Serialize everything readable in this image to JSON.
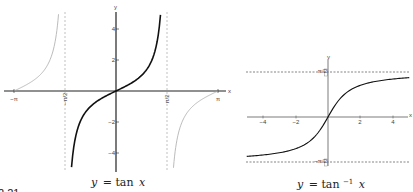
{
  "figure_label": "2.21",
  "chart_data": [
    {
      "type": "line",
      "title": "y = tan x",
      "caption": "y = tan x",
      "xlabel": "x",
      "ylabel": "y",
      "xlim": [
        -3.5,
        3.5
      ],
      "ylim": [
        -5,
        5
      ],
      "x_ticks": [
        {
          "value": -3.14159,
          "label": "−π"
        },
        {
          "value": -1.5708,
          "label": "−π/2"
        },
        {
          "value": 1.5708,
          "label": "π/2"
        },
        {
          "value": 3.14159,
          "label": "π"
        }
      ],
      "y_ticks": [
        {
          "value": 4,
          "label": "4"
        },
        {
          "value": 2,
          "label": "2"
        },
        {
          "value": -2,
          "label": "−2"
        },
        {
          "value": -4,
          "label": "−4"
        }
      ],
      "asymptotes_x": [
        -1.5708,
        1.5708
      ],
      "series": [
        {
          "name": "tan x (principal branch)",
          "style": "bold",
          "color": "#111111",
          "domain": [
            -1.37,
            1.37
          ]
        },
        {
          "name": "tan x (left branch)",
          "style": "thin",
          "color": "#999999",
          "domain": [
            -3.14159,
            -1.77
          ]
        },
        {
          "name": "tan x (right branch)",
          "style": "thin",
          "color": "#999999",
          "domain": [
            1.77,
            3.14159
          ]
        }
      ],
      "grid": false
    },
    {
      "type": "line",
      "title": "y = tan⁻¹ x",
      "caption": "y = tan⁻¹ x",
      "xlabel": "x",
      "ylabel": "y",
      "xlim": [
        -5,
        5
      ],
      "ylim": [
        -2,
        2
      ],
      "x_ticks": [
        {
          "value": -4,
          "label": "−4"
        },
        {
          "value": -2,
          "label": "−2"
        },
        {
          "value": 2,
          "label": "2"
        },
        {
          "value": 4,
          "label": "4"
        }
      ],
      "y_ticks": [
        {
          "value": 1.5708,
          "label": "π/2"
        },
        {
          "value": -1.5708,
          "label": "−π/2"
        }
      ],
      "asymptotes_y": [
        1.5708,
        -1.5708
      ],
      "series": [
        {
          "name": "arctan x",
          "color": "#111111",
          "domain": [
            -5,
            5
          ]
        }
      ],
      "grid": false
    }
  ],
  "labels": {
    "left_caption_y": "y",
    "left_caption_eq": "= tan",
    "left_caption_x": "x",
    "right_caption_y": "y",
    "right_caption_eq": "= tan",
    "right_caption_sup": "−1",
    "right_caption_x": "x",
    "axis_x": "x",
    "axis_y": "y",
    "left_xticks": [
      "−π",
      "−π/2",
      "π/2",
      "π"
    ],
    "left_yticks": [
      "4",
      "2",
      "−2",
      "−4"
    ],
    "right_xticks": [
      "−4",
      "−2",
      "2",
      "4"
    ],
    "right_yticks": [
      "π/2",
      "−π/2"
    ]
  }
}
